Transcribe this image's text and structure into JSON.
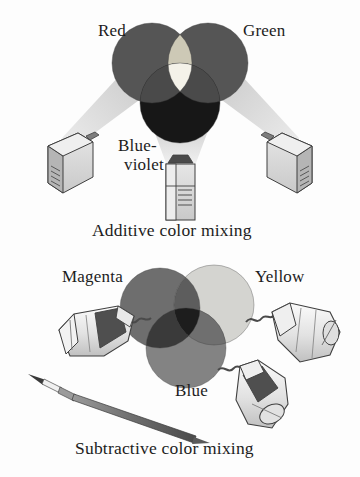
{
  "figure": {
    "title_additive": "Additive color mixing",
    "title_subtractive": "Subtractive color mixing",
    "background_color": "#fdfdfd",
    "text_color": "#1c1c1c"
  },
  "additive": {
    "caption": "Additive color mixing",
    "labels": {
      "red": "Red",
      "green": "Green",
      "blue_violet_line1": "Blue-",
      "blue_violet_line2": "violet"
    },
    "circles": [
      {
        "name": "red",
        "label": "Red",
        "cx": 152,
        "cy": 63,
        "r": 40,
        "fill": "#555555"
      },
      {
        "name": "green",
        "label": "Green",
        "cx": 208,
        "cy": 63,
        "r": 40,
        "fill": "#555555"
      },
      {
        "name": "blue-violet",
        "label": "Blue-violet",
        "cx": 180,
        "cy": 103,
        "r": 40,
        "fill": "#171717"
      }
    ],
    "overlaps": [
      {
        "name": "red-green-yellow",
        "fill": "#cdc9b6"
      },
      {
        "name": "red-blue-magenta",
        "fill": "#4a4a4a"
      },
      {
        "name": "green-blue-cyan",
        "fill": "#4a4a4a"
      },
      {
        "name": "center-white",
        "fill": "#f4f2e9"
      }
    ],
    "devices": [
      {
        "name": "projector-left",
        "kind": "slide-projector"
      },
      {
        "name": "projector-right",
        "kind": "slide-projector"
      },
      {
        "name": "projector-bottom",
        "kind": "slide-projector"
      }
    ],
    "beams": [
      {
        "name": "beam-left",
        "fill": "#d8d8d8"
      },
      {
        "name": "beam-right",
        "fill": "#d8d8d8"
      },
      {
        "name": "beam-bottom",
        "fill": "#d8d8d8"
      }
    ]
  },
  "subtractive": {
    "caption": "Subtractive color mixing",
    "labels": {
      "magenta": "Magenta",
      "yellow": "Yellow",
      "blue": "Blue"
    },
    "circles": [
      {
        "name": "magenta",
        "label": "Magenta",
        "cx": 160,
        "cy": 308,
        "r": 40,
        "fill": "#6e6e6e"
      },
      {
        "name": "yellow",
        "label": "Yellow",
        "cx": 214,
        "cy": 305,
        "r": 40,
        "fill": "#d4d4d0"
      },
      {
        "name": "blue",
        "label": "Blue",
        "cx": 186,
        "cy": 348,
        "r": 40,
        "fill": "#838383"
      }
    ],
    "overlaps": [
      {
        "name": "magenta-yellow-red",
        "fill": "#5d5d5d"
      },
      {
        "name": "magenta-blue-violet",
        "fill": "#3a3a3a"
      },
      {
        "name": "yellow-blue-green",
        "fill": "#6f6f6f"
      },
      {
        "name": "center-black",
        "fill": "#1d1d1d"
      }
    ],
    "devices": [
      {
        "name": "paint-tube-left",
        "kind": "paint-tube"
      },
      {
        "name": "paint-tube-right",
        "kind": "paint-tube"
      },
      {
        "name": "paint-tube-bottom",
        "kind": "paint-tube"
      },
      {
        "name": "paintbrush",
        "kind": "brush"
      }
    ]
  }
}
